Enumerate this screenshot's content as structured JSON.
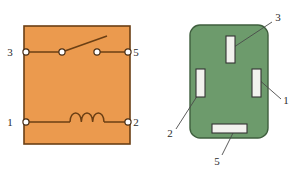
{
  "figure": {
    "background_color": "#ffffff"
  },
  "schematic": {
    "name": "relay-schematic",
    "fill_color": "#eb9a4e",
    "border_color": "#6b3f14",
    "wire_color": "#6b3f14",
    "terminal_fill": "#ffffff",
    "box": {
      "x": 24,
      "y": 26,
      "width": 106,
      "height": 118
    },
    "terminals": [
      {
        "id": "3",
        "label": "3",
        "side": "left",
        "cx": 26,
        "cy": 52,
        "label_x": 10,
        "label_y": 56
      },
      {
        "id": "5",
        "label": "5",
        "side": "right",
        "cx": 128,
        "cy": 52,
        "label_x": 136,
        "label_y": 56
      },
      {
        "id": "1",
        "label": "1",
        "side": "left",
        "cx": 26,
        "cy": 122,
        "label_x": 10,
        "label_y": 126
      },
      {
        "id": "2",
        "label": "2",
        "side": "right",
        "cx": 128,
        "cy": 122,
        "label_x": 136,
        "label_y": 126
      }
    ],
    "switch": {
      "name": "switch-contact",
      "pivot": {
        "cx": 62,
        "cy": 52
      },
      "contact": {
        "cx": 97,
        "cy": 52
      },
      "arm_tip": {
        "x": 107,
        "y": 36
      }
    },
    "coil": {
      "name": "coil-winding",
      "loops": 3,
      "start_x": 70,
      "end_x": 104,
      "baseline_y": 122,
      "peak_y": 110
    }
  },
  "socket": {
    "name": "relay-socket",
    "fill_color": "#6d9b6c",
    "border_color": "#3f5f3e",
    "slot_fill": "#f2f2ee",
    "slot_border": "#333333",
    "leader_color": "#4a4a4a",
    "box": {
      "x": 190,
      "y": 25,
      "width": 78,
      "height": 113,
      "radius": 10
    },
    "slots": [
      {
        "id": "3",
        "label": "3",
        "orientation": "vertical",
        "x": 226,
        "y": 36,
        "width": 9,
        "height": 27,
        "leader_from": {
          "x": 231,
          "y": 49
        },
        "leader_to": {
          "x": 272,
          "y": 22
        },
        "label_x": 278,
        "label_y": 21
      },
      {
        "id": "1",
        "label": "1",
        "orientation": "vertical",
        "x": 252,
        "y": 69,
        "width": 9,
        "height": 28,
        "leader_from": {
          "x": 257,
          "y": 78
        },
        "leader_to": {
          "x": 281,
          "y": 99
        },
        "label_x": 285,
        "label_y": 103
      },
      {
        "id": "2",
        "label": "2",
        "orientation": "vertical",
        "x": 196,
        "y": 69,
        "width": 9,
        "height": 28,
        "leader_from": {
          "x": 201,
          "y": 90
        },
        "leader_to": {
          "x": 176,
          "y": 129
        },
        "label_x": 169,
        "label_y": 136
      },
      {
        "id": "5",
        "label": "5",
        "orientation": "horizontal",
        "x": 212,
        "y": 124,
        "width": 35,
        "height": 9,
        "leader_from": {
          "x": 233,
          "y": 133
        },
        "leader_to": {
          "x": 222,
          "y": 155
        },
        "label_x": 216,
        "label_y": 164
      }
    ]
  }
}
